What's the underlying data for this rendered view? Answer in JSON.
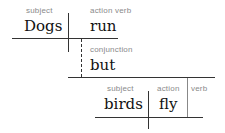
{
  "diagram": {
    "type": "sentence-diagram",
    "clause1": {
      "subject": {
        "label": "subject",
        "word": "Dogs"
      },
      "verb": {
        "label": "action verb",
        "word": "run"
      }
    },
    "conjunction": {
      "label": "conjunction",
      "word": "but"
    },
    "clause2": {
      "subject": {
        "label": "subject",
        "word": "birds"
      },
      "verb": {
        "label": "action",
        "word": "fly"
      },
      "verb_suffix_label": "verb"
    },
    "colors": {
      "line": "#333333",
      "label": "#8a8a8a",
      "word": "#111111"
    }
  }
}
